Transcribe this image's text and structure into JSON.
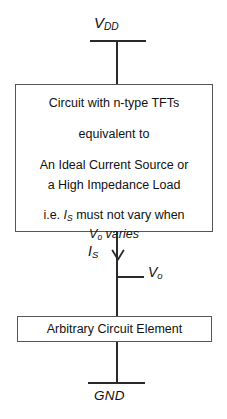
{
  "diagram": {
    "line_color": "#2a2a2a",
    "box_border_color": "#555555",
    "background": "#ffffff",
    "text_color": "#111111"
  },
  "supply": {
    "label_plain": "VDD",
    "label_main": "V",
    "label_sub": "DD",
    "rail_name": "vdd-rail"
  },
  "ground": {
    "label": "GND",
    "rail_name": "gnd-rail"
  },
  "top_box": {
    "name": "circuit-block",
    "lines": [
      "Circuit with n-type TFTs",
      "equivalent to",
      "An Ideal Current Source or",
      "a High Impedance Load"
    ],
    "note_prefix": "i.e. ",
    "note_symbol_main": "I",
    "note_symbol_sub": "S",
    "note_middle": " must not vary when",
    "note_symbol2_main": "V",
    "note_symbol2_sub": "o",
    "note_suffix": " varies"
  },
  "bottom_box": {
    "name": "arbitrary-circuit-element",
    "label": "Arbitrary Circuit Element"
  },
  "node_labels": {
    "current_main": "I",
    "current_sub": "S",
    "voltage_main": "V",
    "voltage_sub": "o"
  }
}
